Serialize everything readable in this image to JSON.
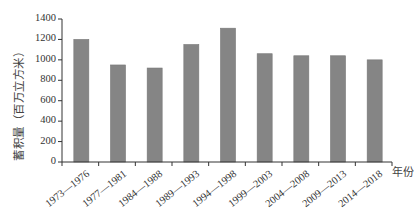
{
  "chart_data": {
    "type": "bar",
    "title": "",
    "xlabel": "年份",
    "ylabel": "蓄积量（百万立方米）",
    "categories": [
      "1973—1976",
      "1977—1981",
      "1984—1988",
      "1989—1993",
      "1994—1998",
      "1999—2003",
      "2004—2008",
      "2009—2013",
      "2014—2018"
    ],
    "values": [
      1200,
      950,
      920,
      1150,
      1310,
      1060,
      1040,
      1040,
      1000
    ],
    "ylim": [
      0,
      1400
    ],
    "yticks": [
      0,
      200,
      400,
      600,
      800,
      1000,
      1200,
      1400
    ],
    "grid": false,
    "legend": null,
    "bar_color": "#858585"
  },
  "axes": {
    "y_tick_labels": [
      "0",
      "200",
      "400",
      "600",
      "800",
      "1000",
      "1200",
      "1400"
    ],
    "y_title": "蓄积量（百万立方米）",
    "x_unit": "年份"
  }
}
